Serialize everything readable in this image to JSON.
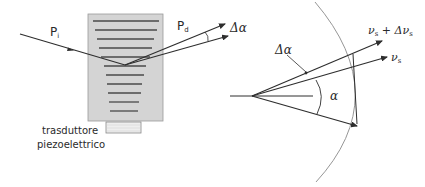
{
  "left_panel": {
    "incident_label": "P",
    "incident_sub": "i",
    "diffracted_label": "P",
    "diffracted_sub": "d",
    "delta_alpha": "Δα",
    "transducer_label_line1": "trasduttore",
    "transducer_label_line2": "piezoelettrico"
  },
  "right_panel": {
    "vector_top_label": "ν",
    "vector_top_sub": "s",
    "vector_top_plus": " + Δν",
    "vector_top_sub2": "s",
    "vector_mid_label": "ν",
    "vector_mid_sub": "s",
    "delta_alpha": "Δα",
    "alpha": "α"
  },
  "colors": {
    "line": "#2e2e2e",
    "crystal_fill": "#d4d4d4",
    "crystal_border": "#9a9a9a",
    "grating_line": "#4a4a4a",
    "arc": "#8a8a8a"
  }
}
